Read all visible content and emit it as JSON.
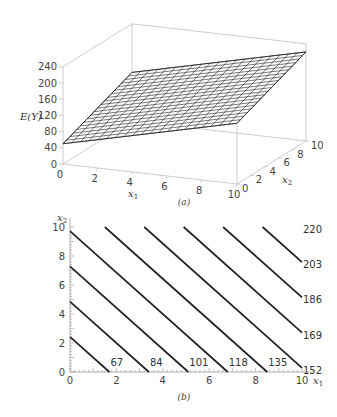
{
  "chart_data": [
    {
      "type": "surface",
      "panel": "(a)",
      "model": "E(Y) = 50 + 10 x1 + 7 x2",
      "xlabel": "x1",
      "ylabel": "x2",
      "zlabel": "E(Y)",
      "xlim": [
        0,
        10
      ],
      "ylim": [
        0,
        10
      ],
      "zlim": [
        0,
        240
      ],
      "x_ticks": [
        "0",
        "2",
        "4",
        "6",
        "8",
        "10"
      ],
      "y_ticks": [
        "0",
        "2",
        "4",
        "6",
        "8",
        "10"
      ],
      "z_ticks": [
        "0",
        "40",
        "80",
        "120",
        "160",
        "200",
        "240"
      ],
      "corners": [
        {
          "x1": 0,
          "x2": 0,
          "EY": 50
        },
        {
          "x1": 10,
          "x2": 0,
          "EY": 150
        },
        {
          "x1": 0,
          "x2": 10,
          "EY": 120
        },
        {
          "x1": 10,
          "x2": 10,
          "EY": 220
        }
      ],
      "grid": true
    },
    {
      "type": "contour",
      "panel": "(b)",
      "xlabel": "x1",
      "ylabel": "x2",
      "xlim": [
        0,
        10
      ],
      "ylim": [
        0,
        10
      ],
      "x_ticks": [
        "0",
        "2",
        "4",
        "6",
        "8",
        "10"
      ],
      "y_ticks": [
        "0",
        "2",
        "4",
        "6",
        "8",
        "10"
      ],
      "levels": [
        67,
        84,
        101,
        118,
        135,
        152,
        169,
        186,
        203,
        220
      ]
    }
  ],
  "captions": {
    "a": "(a)",
    "b": "(b)"
  },
  "labels": {
    "ey": "E(Y)",
    "x1": "x",
    "x2": "x",
    "sub1": "1",
    "sub2": "2"
  }
}
